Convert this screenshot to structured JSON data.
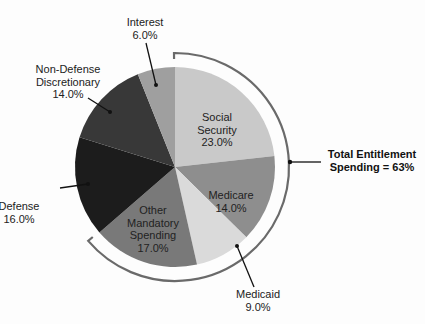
{
  "chart_data": {
    "type": "pie",
    "title": "",
    "categories": [
      "Social Security",
      "Medicare",
      "Medicaid",
      "Other Mandatory Spending",
      "Defense",
      "Non-Defense Discretionary",
      "Interest"
    ],
    "values": [
      23.0,
      14.0,
      9.0,
      17.0,
      16.0,
      14.0,
      6.0
    ],
    "unit": "%",
    "colors": [
      "#c9c9c9",
      "#8e8e8e",
      "#dadada",
      "#797979",
      "#1c1c1c",
      "#383838",
      "#9f9f9f"
    ],
    "start_angle_deg": 0,
    "direction": "clockwise",
    "labels": [
      {
        "lines": [
          "Social",
          "Security",
          "23.0%"
        ]
      },
      {
        "lines": [
          "Medicare",
          "14.0%"
        ]
      },
      {
        "lines": [
          "Medicaid",
          "9.0%"
        ]
      },
      {
        "lines": [
          "Other",
          "Mandatory",
          "Spending",
          "17.0%"
        ]
      },
      {
        "lines": [
          "Defense",
          "16.0%"
        ]
      },
      {
        "lines": [
          "Non-Defense",
          "Discretionary",
          "14.0%"
        ]
      },
      {
        "lines": [
          "Interest",
          "6.0%"
        ]
      }
    ],
    "annotation": {
      "lines": [
        "Total Entitlement",
        "Spending = 63%"
      ],
      "brackets": [
        "Social Security",
        "Medicare",
        "Medicaid",
        "Other Mandatory Spending"
      ]
    }
  }
}
